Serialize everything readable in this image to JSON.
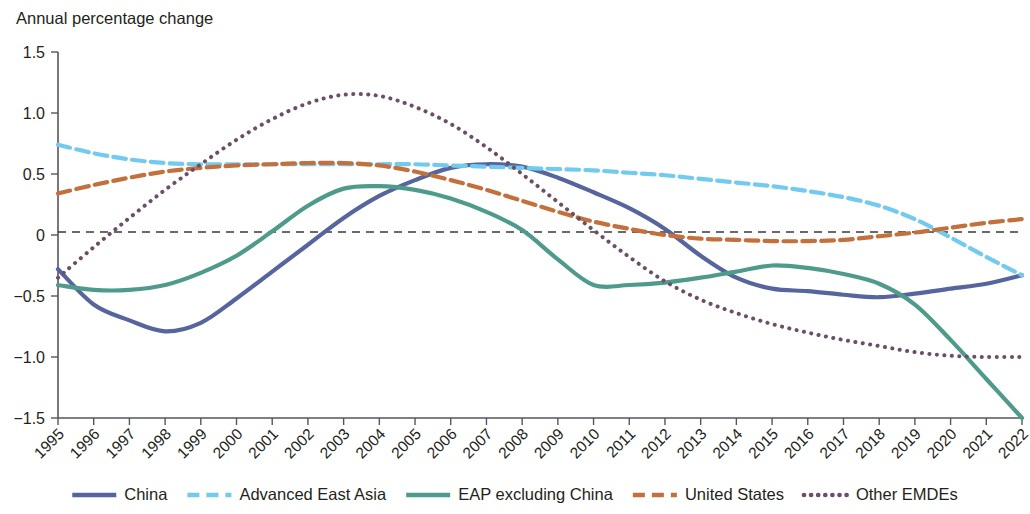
{
  "chart_data": {
    "type": "line",
    "title": "Annual percentage change",
    "xlabel": "",
    "ylabel": "",
    "ylim": [
      -1.5,
      1.5
    ],
    "yticks": [
      "1.5",
      "1.0",
      "0.5",
      "0",
      "−0.5",
      "−1.0",
      "−1.5"
    ],
    "ytick_values": [
      1.5,
      1.0,
      0.5,
      0,
      -0.5,
      -1.0,
      -1.5
    ],
    "grid": false,
    "zero_line": true,
    "legend_position": "bottom",
    "x": [
      1995,
      1996,
      1997,
      1998,
      1999,
      2000,
      2001,
      2002,
      2003,
      2004,
      2005,
      2006,
      2007,
      2008,
      2009,
      2010,
      2011,
      2012,
      2013,
      2014,
      2015,
      2016,
      2017,
      2018,
      2019,
      2020,
      2021,
      2022
    ],
    "categories": [
      "1995",
      "1996",
      "1997",
      "1998",
      "1999",
      "2000",
      "2001",
      "2002",
      "2003",
      "2004",
      "2005",
      "2006",
      "2007",
      "2008",
      "2009",
      "2010",
      "2011",
      "2012",
      "2013",
      "2014",
      "2015",
      "2016",
      "2017",
      "2018",
      "2019",
      "2020",
      "2021",
      "2022"
    ],
    "series": [
      {
        "name": "China",
        "color": "#56659E",
        "dash": "none",
        "width": 4.2,
        "values": [
          -0.28,
          -0.57,
          -0.7,
          -0.79,
          -0.72,
          -0.52,
          -0.3,
          -0.08,
          0.14,
          0.32,
          0.45,
          0.55,
          0.58,
          0.56,
          0.47,
          0.35,
          0.22,
          0.05,
          -0.17,
          -0.35,
          -0.44,
          -0.46,
          -0.49,
          -0.51,
          -0.48,
          -0.44,
          -0.4,
          -0.33
        ]
      },
      {
        "name": "Advanced East Asia",
        "color": "#72CBEF",
        "dash": "dashed",
        "width": 4.2,
        "values": [
          0.74,
          0.67,
          0.62,
          0.59,
          0.58,
          0.58,
          0.58,
          0.58,
          0.58,
          0.58,
          0.58,
          0.57,
          0.56,
          0.55,
          0.54,
          0.53,
          0.51,
          0.49,
          0.46,
          0.43,
          0.4,
          0.36,
          0.31,
          0.24,
          0.13,
          -0.02,
          -0.18,
          -0.33
        ]
      },
      {
        "name": "EAP excluding China",
        "color": "#4E9B8C",
        "dash": "none",
        "width": 4.2,
        "values": [
          -0.41,
          -0.45,
          -0.45,
          -0.41,
          -0.31,
          -0.17,
          0.03,
          0.24,
          0.38,
          0.4,
          0.37,
          0.3,
          0.19,
          0.04,
          -0.2,
          -0.41,
          -0.41,
          -0.39,
          -0.35,
          -0.3,
          -0.25,
          -0.27,
          -0.32,
          -0.4,
          -0.57,
          -0.86,
          -1.18,
          -1.5
        ]
      },
      {
        "name": "United States",
        "color": "#C4703C",
        "dash": "dashed",
        "width": 4.2,
        "values": [
          0.34,
          0.41,
          0.47,
          0.52,
          0.55,
          0.57,
          0.58,
          0.59,
          0.59,
          0.57,
          0.52,
          0.45,
          0.37,
          0.28,
          0.19,
          0.11,
          0.05,
          0.0,
          -0.03,
          -0.04,
          -0.05,
          -0.05,
          -0.04,
          -0.01,
          0.02,
          0.06,
          0.1,
          0.13
        ]
      },
      {
        "name": "Other EMDEs",
        "color": "#6B4E68",
        "dash": "dotted",
        "width": 4.0,
        "values": [
          -0.35,
          -0.1,
          0.14,
          0.37,
          0.58,
          0.78,
          0.95,
          1.08,
          1.15,
          1.14,
          1.05,
          0.91,
          0.72,
          0.5,
          0.27,
          0.04,
          -0.18,
          -0.38,
          -0.53,
          -0.64,
          -0.73,
          -0.8,
          -0.86,
          -0.91,
          -0.96,
          -0.99,
          -1.0,
          -1.0
        ]
      }
    ],
    "legend": [
      {
        "label": "China",
        "color": "#56659E",
        "dash": "none"
      },
      {
        "label": "Advanced East Asia",
        "color": "#72CBEF",
        "dash": "dashed"
      },
      {
        "label": "EAP excluding China",
        "color": "#4E9B8C",
        "dash": "none"
      },
      {
        "label": "United States",
        "color": "#C4703C",
        "dash": "dashed"
      },
      {
        "label": "Other EMDEs",
        "color": "#6B4E68",
        "dash": "dotted"
      }
    ]
  }
}
